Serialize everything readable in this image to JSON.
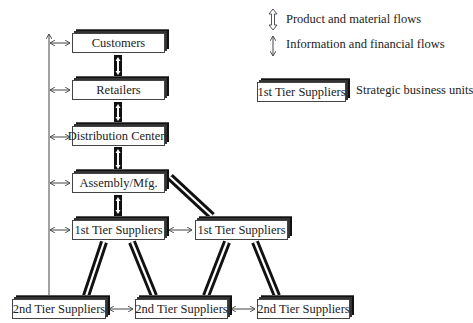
{
  "legend": {
    "product_flow_label": "Product and material flows",
    "info_flow_label": "Information and financial flows",
    "sample_box_label": "1st Tier Suppliers",
    "sample_box_caption": "Strategic business units"
  },
  "nodes": {
    "customers": "Customers",
    "retailers": "Retailers",
    "distribution_centers": "Distribution Centers",
    "assembly": "Assembly/Mfg.",
    "tier1_left": "1st Tier Suppliers",
    "tier1_right": "1st Tier Suppliers",
    "tier2_left": "2nd Tier Suppliers",
    "tier2_middle": "2nd Tier Suppliers",
    "tier2_right": "2nd Tier Suppliers"
  },
  "colors": {
    "line": "#444444",
    "shadow": "#111111",
    "face": "#ffffff"
  }
}
